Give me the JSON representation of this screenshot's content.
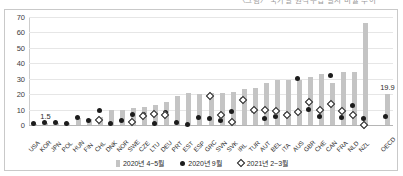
{
  "caption": {
    "text": "〈그림〉 국가별 원격수업 실시 비율 추이"
  },
  "legend": {
    "position": "bottom",
    "items": [
      {
        "key": "bar",
        "label": "2020년 4~5월",
        "marker": "gray-bar",
        "color": "#c4c4c4"
      },
      {
        "key": "dot",
        "label": "2020년 9월",
        "marker": "black-dot",
        "color": "#1c1c1c"
      },
      {
        "key": "diamond",
        "label": "2021년 2~3월",
        "marker": "open-diamond",
        "color": "#1c1c1c"
      }
    ]
  },
  "chart_data": {
    "type": "bar",
    "title": "",
    "subtitle": "",
    "xlabel": "",
    "ylabel": "",
    "ylim": [
      0,
      70
    ],
    "yticks": [
      0,
      10,
      20,
      30,
      40,
      50,
      60,
      70
    ],
    "grid": true,
    "categories": [
      "USA",
      "KOR",
      "JPN",
      "POL",
      "HUN",
      "FIN",
      "CHL",
      "DNK",
      "NOR",
      "SWE",
      "CZE",
      "LTU",
      "DEU",
      "PRT",
      "EST",
      "ESP",
      "GRC",
      "SVN",
      "SVK",
      "IRL",
      "TUR",
      "AUT",
      "BEL",
      "ITA",
      "AUS",
      "GBR",
      "CHE",
      "CAN",
      "FRA",
      "NLD",
      "NZL",
      "",
      "OECD"
    ],
    "series": [
      {
        "name": "2020년 4~5월",
        "marker": "gray-bar",
        "color": "#c4c4c4",
        "values": [
          0.8,
          1.5,
          1.4,
          1.2,
          4.5,
          4.0,
          5.0,
          10.0,
          9.5,
          11.0,
          12.0,
          13.0,
          15.0,
          19.0,
          20.5,
          20.0,
          20.5,
          21.0,
          21.5,
          23.5,
          24.0,
          27.0,
          29.5,
          29.5,
          29.0,
          31.0,
          33.0,
          27.0,
          34.5,
          34.5,
          66.0,
          null,
          19.9
        ]
      },
      {
        "name": "2020년 9월",
        "marker": "black-dot",
        "color": "#1c1c1c",
        "values": [
          0.8,
          1.5,
          1.4,
          0.8,
          4.8,
          2.8,
          9.3,
          1.2,
          2.6,
          6.8,
          6.5,
          1.0,
          8.0,
          1.5,
          0.3,
          4.7,
          4.5,
          2.7,
          8.5,
          16.5,
          9.5,
          4.3,
          5.3,
          6.5,
          30.0,
          9.8,
          5.8,
          32.3,
          4.8,
          12.6,
          4.0,
          null,
          5.7
        ]
      },
      {
        "name": "2021년 2~3월",
        "marker": "open-diamond",
        "color": "#1c1c1c",
        "values": [
          null,
          null,
          null,
          null,
          null,
          null,
          3.2,
          null,
          null,
          2.0,
          6.0,
          7.0,
          6.3,
          null,
          null,
          null,
          19.0,
          6.8,
          1.8,
          16.3,
          9.5,
          9.8,
          9.3,
          6.8,
          8.5,
          14.8,
          9.8,
          13.8,
          8.8,
          6.3,
          0.3,
          null,
          null
        ]
      }
    ],
    "point_labels": [
      {
        "category": "KOR",
        "value": 1.5,
        "text": "1.5"
      },
      {
        "category": "OECD",
        "value": 19.9,
        "text": "19.9"
      }
    ]
  }
}
